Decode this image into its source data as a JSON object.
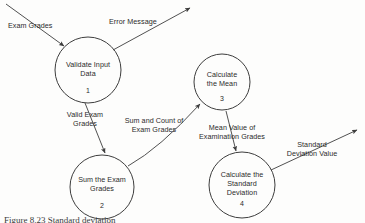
{
  "diagram": {
    "type": "data-flow-diagram",
    "background_color": "#fdfdfc",
    "line_color": "#3d3d3d",
    "text_color": "#2b2b2b",
    "processes": [
      {
        "id": "process-1",
        "number": "1",
        "name_lines": [
          "Validate Input",
          "Data"
        ],
        "cx": 88,
        "cy": 70,
        "r": 33
      },
      {
        "id": "process-2",
        "number": "2",
        "name_lines": [
          "Sum the Exam",
          "Grades"
        ],
        "cx": 102,
        "cy": 187,
        "r": 32
      },
      {
        "id": "process-3",
        "number": "3",
        "name_lines": [
          "Calculate",
          "the Mean"
        ],
        "cx": 222,
        "cy": 82,
        "r": 28
      },
      {
        "id": "process-4",
        "number": "4",
        "name_lines": [
          "Calculate the",
          "Standard",
          "Deviation"
        ],
        "cx": 242,
        "cy": 185,
        "r": 33
      }
    ],
    "flows": [
      {
        "id": "flow-exam-grades",
        "label_lines": [
          "Exam Grades"
        ],
        "from": "external-source",
        "to": "process-1",
        "label_x": 42,
        "label_y": 15
      },
      {
        "id": "flow-error-message",
        "label_lines": [
          "Error Message"
        ],
        "from": "process-1",
        "to": "external-sink",
        "label_x": 143,
        "label_y": 23
      },
      {
        "id": "flow-valid-exam-grades",
        "label_lines": [
          "Valid Exam",
          "Grades"
        ],
        "from": "process-1",
        "to": "process-2",
        "label_x": 85,
        "label_y": 115
      },
      {
        "id": "flow-sum-and-count",
        "label_lines": [
          "Sum and Count of",
          "Exam Grades"
        ],
        "from": "process-2",
        "to": "process-3",
        "label_x": 154,
        "label_y": 121
      },
      {
        "id": "flow-mean-value",
        "label_lines": [
          "Mean Value of",
          "Examination Grades"
        ],
        "from": "process-3",
        "to": "process-4",
        "label_x": 232,
        "label_y": 128
      },
      {
        "id": "flow-standard-deviation-value",
        "label_lines": [
          "Standard",
          "Deviation Value"
        ],
        "from": "process-4",
        "to": "external-sink",
        "label_x": 311,
        "label_y": 146
      }
    ]
  },
  "caption": {
    "figure_number": "Figure 8.23",
    "text": "Figure 8.23  Standard deviation"
  }
}
